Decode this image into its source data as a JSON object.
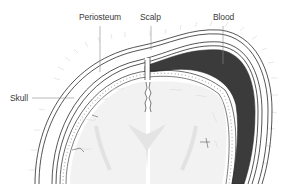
{
  "diagram": {
    "labels": {
      "periosteum": "Periosteum",
      "scalp": "Scalp",
      "blood": "Blood",
      "skull": "Skull"
    },
    "colors": {
      "outline": "#2a2a2a",
      "blood_fill": "#3b3b3b",
      "brain_fill": "#f1f1f1",
      "brain_shade": "#e2e2e2",
      "dura_dots": "#b5b5b5",
      "label_text": "#3a3a3a",
      "leader_line": "#8a8a8a",
      "hair": "#c8c8c8"
    }
  }
}
